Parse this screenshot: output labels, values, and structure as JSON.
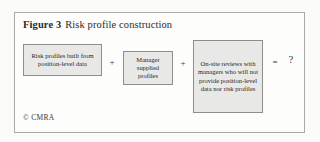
{
  "figure": {
    "label": "Figure 3",
    "caption": "Risk profile construction",
    "copyright": "© CMRA"
  },
  "diagram": {
    "nodes": [
      {
        "id": "node-1",
        "text": "Risk profiles built from position-level data"
      },
      {
        "id": "node-2",
        "text": "Manager supplied profiles"
      },
      {
        "id": "node-3",
        "text": "On-site reviews with managers who will not provide position-level data nor risk profiles"
      }
    ],
    "operators": {
      "plus_1": "+",
      "plus_2": "+",
      "equals": "=",
      "result": "?"
    }
  },
  "colors": {
    "frame_border": "#a9a9a8",
    "node_fill": "#e8e8e6",
    "node_border": "#8e8e8d",
    "text": "#262626",
    "page_background": "#fbfbfa"
  }
}
